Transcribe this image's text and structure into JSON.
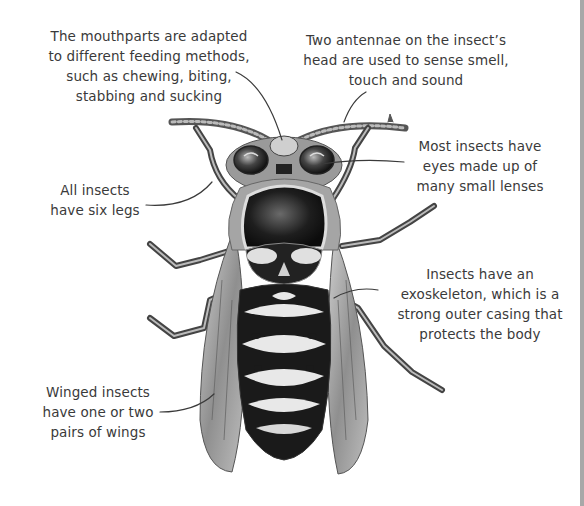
{
  "diagram": {
    "colors": {
      "text": "#3a3a3a",
      "leader_line": "#3a3a3a",
      "background": "#ffffff",
      "body_dark": "#1a1a1a",
      "body_light": "#e8e8e8",
      "right_edge_bar": "#a8a8a8"
    },
    "labels": {
      "mouthparts": {
        "lines": [
          "The mouthparts are adapted",
          "to different feeding methods,",
          "such as chewing, biting,",
          "stabbing and sucking"
        ]
      },
      "antennae": {
        "lines": [
          "Two antennae on the insect’s",
          "head are used to sense smell,",
          "touch and sound"
        ]
      },
      "eyes": {
        "lines": [
          "Most insects have",
          "eyes made up of",
          "many small lenses"
        ]
      },
      "legs": {
        "lines": [
          "All insects",
          "have six legs"
        ]
      },
      "exoskeleton": {
        "lines": [
          "Insects have an",
          "exoskeleton, which is a",
          "strong outer casing that",
          "protects the body"
        ]
      },
      "wings": {
        "lines": [
          "Winged insects",
          "have one or two",
          "pairs of wings"
        ]
      }
    }
  }
}
